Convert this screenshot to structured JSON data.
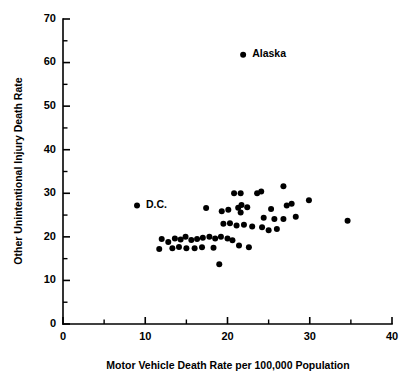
{
  "chart_data": {
    "type": "scatter",
    "title": "",
    "xlabel": "Motor Vehicle Death Rate per 100,000 Population",
    "ylabel": "Other Unintentional Injury Death Rate",
    "xlim": [
      0,
      40
    ],
    "ylim": [
      0,
      70
    ],
    "xticks": [
      0,
      10,
      20,
      30,
      40
    ],
    "yticks": [
      0,
      10,
      20,
      30,
      40,
      50,
      60,
      70
    ],
    "xticklabels": [
      "0",
      "10",
      "20",
      "30",
      "40"
    ],
    "yticklabels": [
      "0",
      "10",
      "20",
      "30",
      "40",
      "50",
      "60",
      "70"
    ],
    "xminor_step": 5,
    "yminor_step": 5,
    "grid": false,
    "legend": null,
    "marker": "filled-circle",
    "marker_color": "#000000",
    "points": [
      {
        "x": 21.9,
        "y": 61.8,
        "label": "Alaska"
      },
      {
        "x": 9.0,
        "y": 27.2,
        "label": "D.C."
      },
      {
        "x": 20.8,
        "y": 30.0,
        "label": ""
      },
      {
        "x": 21.6,
        "y": 30.0,
        "label": ""
      },
      {
        "x": 23.6,
        "y": 30.0,
        "label": ""
      },
      {
        "x": 24.1,
        "y": 30.4,
        "label": ""
      },
      {
        "x": 26.8,
        "y": 31.6,
        "label": ""
      },
      {
        "x": 17.4,
        "y": 26.6,
        "label": ""
      },
      {
        "x": 19.3,
        "y": 25.9,
        "label": ""
      },
      {
        "x": 20.1,
        "y": 26.2,
        "label": ""
      },
      {
        "x": 21.3,
        "y": 26.7,
        "label": ""
      },
      {
        "x": 21.6,
        "y": 25.6,
        "label": ""
      },
      {
        "x": 21.7,
        "y": 27.3,
        "label": ""
      },
      {
        "x": 22.4,
        "y": 26.8,
        "label": ""
      },
      {
        "x": 25.3,
        "y": 26.4,
        "label": ""
      },
      {
        "x": 27.2,
        "y": 27.2,
        "label": ""
      },
      {
        "x": 27.8,
        "y": 27.6,
        "label": ""
      },
      {
        "x": 29.9,
        "y": 28.4,
        "label": ""
      },
      {
        "x": 24.4,
        "y": 24.4,
        "label": ""
      },
      {
        "x": 25.7,
        "y": 24.1,
        "label": ""
      },
      {
        "x": 26.8,
        "y": 24.1,
        "label": ""
      },
      {
        "x": 28.3,
        "y": 24.6,
        "label": ""
      },
      {
        "x": 34.6,
        "y": 23.7,
        "label": ""
      },
      {
        "x": 19.5,
        "y": 23.0,
        "label": ""
      },
      {
        "x": 20.3,
        "y": 23.1,
        "label": ""
      },
      {
        "x": 21.1,
        "y": 22.6,
        "label": ""
      },
      {
        "x": 22.0,
        "y": 22.8,
        "label": ""
      },
      {
        "x": 23.0,
        "y": 22.4,
        "label": ""
      },
      {
        "x": 24.2,
        "y": 22.2,
        "label": ""
      },
      {
        "x": 25.0,
        "y": 21.5,
        "label": ""
      },
      {
        "x": 26.0,
        "y": 21.8,
        "label": ""
      },
      {
        "x": 12.0,
        "y": 19.5,
        "label": ""
      },
      {
        "x": 12.8,
        "y": 18.8,
        "label": ""
      },
      {
        "x": 13.6,
        "y": 19.6,
        "label": ""
      },
      {
        "x": 14.3,
        "y": 19.4,
        "label": ""
      },
      {
        "x": 14.9,
        "y": 20.0,
        "label": ""
      },
      {
        "x": 15.6,
        "y": 19.3,
        "label": ""
      },
      {
        "x": 16.3,
        "y": 19.5,
        "label": ""
      },
      {
        "x": 17.0,
        "y": 19.8,
        "label": ""
      },
      {
        "x": 17.8,
        "y": 20.0,
        "label": ""
      },
      {
        "x": 18.5,
        "y": 19.6,
        "label": ""
      },
      {
        "x": 19.2,
        "y": 20.0,
        "label": ""
      },
      {
        "x": 20.0,
        "y": 19.6,
        "label": ""
      },
      {
        "x": 20.6,
        "y": 19.2,
        "label": ""
      },
      {
        "x": 11.7,
        "y": 17.2,
        "label": ""
      },
      {
        "x": 13.3,
        "y": 17.4,
        "label": ""
      },
      {
        "x": 14.1,
        "y": 17.7,
        "label": ""
      },
      {
        "x": 15.0,
        "y": 17.4,
        "label": ""
      },
      {
        "x": 16.0,
        "y": 17.4,
        "label": ""
      },
      {
        "x": 16.9,
        "y": 17.6,
        "label": ""
      },
      {
        "x": 18.3,
        "y": 17.5,
        "label": ""
      },
      {
        "x": 21.4,
        "y": 18.0,
        "label": ""
      },
      {
        "x": 22.6,
        "y": 17.6,
        "label": ""
      },
      {
        "x": 19.0,
        "y": 13.7,
        "label": ""
      }
    ],
    "annotations": [
      {
        "text": "Alaska",
        "x": 21.9,
        "y": 61.8,
        "position": "right"
      },
      {
        "text": "D.C.",
        "x": 9.0,
        "y": 27.2,
        "position": "right"
      }
    ]
  }
}
